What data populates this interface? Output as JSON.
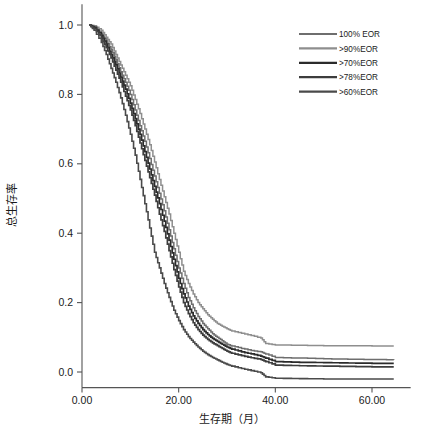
{
  "chart_data": {
    "type": "line",
    "title": "",
    "subtitle": "",
    "xlabel": "生存期（月）",
    "ylabel": "总生存率",
    "xlim": [
      -3,
      68
    ],
    "ylim": [
      -0.06,
      1.06
    ],
    "grid": false,
    "legend_position": "top-right",
    "xticks": [
      "0.00",
      "20.00",
      "40.00",
      "60.00"
    ],
    "xtick_values": [
      0,
      20,
      40,
      60
    ],
    "yticks": [
      "0.0",
      "0.2",
      "0.4",
      "0.6",
      "0.8",
      "1.0"
    ],
    "ytick_values": [
      0.0,
      0.2,
      0.4,
      0.6,
      0.8,
      1.0
    ],
    "step_style": "post",
    "series": [
      {
        "name": "100% EOR",
        "color": "#6e6e6e",
        "width": 1.5,
        "final_value": 0.035,
        "x": [
          1.5,
          2.5,
          4,
          5,
          6,
          7,
          8,
          9,
          10,
          11,
          12,
          13,
          14,
          15,
          16,
          17,
          18,
          19,
          20,
          21,
          22,
          23,
          24,
          25,
          26,
          27,
          28,
          29,
          30,
          31,
          33,
          35,
          37,
          38,
          40,
          45,
          50,
          55,
          60,
          64.5
        ],
        "y": [
          1.0,
          0.995,
          0.975,
          0.955,
          0.93,
          0.9,
          0.865,
          0.835,
          0.8,
          0.755,
          0.71,
          0.665,
          0.615,
          0.565,
          0.515,
          0.465,
          0.41,
          0.355,
          0.3,
          0.255,
          0.215,
          0.185,
          0.16,
          0.14,
          0.125,
          0.11,
          0.1,
          0.09,
          0.08,
          0.075,
          0.068,
          0.062,
          0.058,
          0.052,
          0.042,
          0.04,
          0.038,
          0.037,
          0.036,
          0.035
        ]
      },
      {
        "name": ">90%EOR",
        "color": "#8e8e8e",
        "width": 1.5,
        "final_value": 0.075,
        "x": [
          1.5,
          2.5,
          4,
          5,
          6,
          7,
          8,
          9,
          10,
          11,
          12,
          13,
          14,
          15,
          16,
          17,
          18,
          19,
          20,
          21,
          22,
          23,
          24,
          25,
          26,
          27,
          28,
          29,
          30,
          31,
          33,
          35,
          37,
          38,
          40,
          45,
          50,
          55,
          60,
          64.5
        ],
        "y": [
          1.0,
          0.998,
          0.985,
          0.965,
          0.945,
          0.915,
          0.885,
          0.855,
          0.825,
          0.785,
          0.745,
          0.7,
          0.655,
          0.605,
          0.555,
          0.505,
          0.455,
          0.4,
          0.345,
          0.29,
          0.255,
          0.225,
          0.2,
          0.182,
          0.165,
          0.152,
          0.14,
          0.132,
          0.125,
          0.118,
          0.112,
          0.105,
          0.098,
          0.082,
          0.078,
          0.077,
          0.076,
          0.076,
          0.075,
          0.075
        ]
      },
      {
        "name": ">70%EOR",
        "color": "#2b2b2b",
        "width": 1.7,
        "final_value": 0.025,
        "x": [
          1.5,
          2.5,
          4,
          5,
          6,
          7,
          8,
          9,
          10,
          11,
          12,
          13,
          14,
          15,
          16,
          17,
          18,
          19,
          20,
          21,
          22,
          23,
          24,
          25,
          26,
          27,
          28,
          29,
          30,
          31,
          33,
          35,
          37,
          38,
          40,
          45,
          50,
          55,
          60,
          64.5
        ],
        "y": [
          1.0,
          0.993,
          0.97,
          0.945,
          0.915,
          0.885,
          0.85,
          0.815,
          0.775,
          0.73,
          0.685,
          0.635,
          0.585,
          0.535,
          0.485,
          0.435,
          0.38,
          0.325,
          0.27,
          0.225,
          0.19,
          0.162,
          0.14,
          0.122,
          0.108,
          0.097,
          0.088,
          0.08,
          0.072,
          0.066,
          0.058,
          0.052,
          0.046,
          0.04,
          0.03,
          0.028,
          0.027,
          0.026,
          0.025,
          0.025
        ]
      },
      {
        "name": ">78%EOR",
        "color": "#3d3d3d",
        "width": 1.7,
        "final_value": 0.015,
        "x": [
          1.5,
          2.5,
          4,
          5,
          6,
          7,
          8,
          9,
          10,
          11,
          12,
          13,
          14,
          15,
          16,
          17,
          18,
          19,
          20,
          21,
          22,
          23,
          24,
          25,
          26,
          27,
          28,
          29,
          30,
          31,
          33,
          35,
          37,
          38,
          40,
          45,
          50,
          55,
          60,
          64.5
        ],
        "y": [
          1.0,
          0.99,
          0.962,
          0.935,
          0.905,
          0.87,
          0.835,
          0.795,
          0.755,
          0.71,
          0.66,
          0.61,
          0.56,
          0.51,
          0.455,
          0.405,
          0.35,
          0.295,
          0.245,
          0.2,
          0.168,
          0.142,
          0.122,
          0.106,
          0.094,
          0.084,
          0.076,
          0.068,
          0.06,
          0.054,
          0.047,
          0.041,
          0.036,
          0.03,
          0.02,
          0.018,
          0.017,
          0.016,
          0.015,
          0.015
        ]
      },
      {
        "name": ">60%EOR",
        "color": "#4a4a4a",
        "width": 1.6,
        "final_value": -0.02,
        "x": [
          1.5,
          2.5,
          4,
          5,
          6,
          7,
          8,
          9,
          10,
          11,
          12,
          13,
          14,
          15,
          16,
          17,
          18,
          19,
          20,
          21,
          22,
          23,
          24,
          25,
          26,
          27,
          28,
          29,
          30,
          31,
          33,
          35,
          37,
          38,
          40,
          45,
          50,
          55,
          60,
          64.5
        ],
        "y": [
          1.0,
          0.985,
          0.95,
          0.915,
          0.875,
          0.835,
          0.79,
          0.74,
          0.685,
          0.625,
          0.555,
          0.485,
          0.415,
          0.345,
          0.3,
          0.255,
          0.215,
          0.178,
          0.148,
          0.122,
          0.102,
          0.086,
          0.072,
          0.06,
          0.05,
          0.042,
          0.035,
          0.028,
          0.022,
          0.017,
          0.01,
          0.004,
          -0.002,
          -0.014,
          -0.018,
          -0.019,
          -0.02,
          -0.02,
          -0.02,
          -0.02
        ]
      }
    ]
  }
}
